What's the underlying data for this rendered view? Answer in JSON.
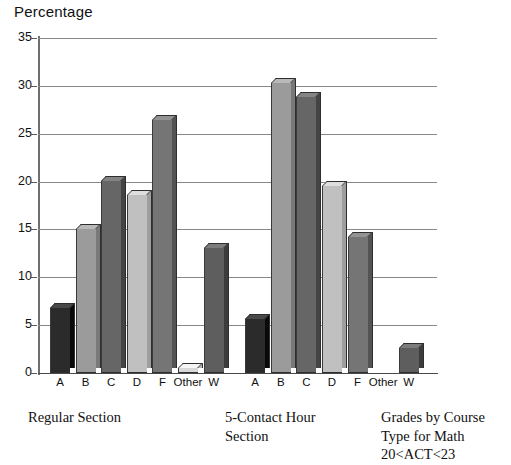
{
  "chart_data": {
    "type": "bar",
    "title": "Percentage",
    "xlabel": "",
    "ylabel": "Percentage",
    "ylim": [
      0,
      35
    ],
    "yticks": [
      0,
      5,
      10,
      15,
      20,
      25,
      30,
      35
    ],
    "grid": true,
    "legend": "none",
    "categories": [
      "A",
      "B",
      "C",
      "D",
      "F",
      "Other",
      "W"
    ],
    "series": [
      {
        "name": "Regular Section",
        "values": [
          6.8,
          15.0,
          20.1,
          18.6,
          26.4,
          0.5,
          13.1
        ]
      },
      {
        "name": "5-Contact Hour Section",
        "values": [
          5.6,
          30.3,
          28.8,
          19.5,
          14.2,
          0.0,
          2.6
        ]
      }
    ],
    "annotations": [
      "Regular Section",
      "5-Contact Hour Section",
      "Grades by Course Type for Math 20<ACT<23"
    ],
    "bar_colors": [
      "#2b2b2b",
      "#9b9b9b",
      "#666666",
      "#c0c0c0",
      "#757575",
      "#d8d8d8",
      "#5e5e5e"
    ]
  },
  "axis": {
    "y_tick_labels": [
      "35",
      "30",
      "25",
      "20",
      "15",
      "10",
      "5",
      "0"
    ],
    "x_tick_labels_group1": [
      "A",
      "B",
      "C",
      "D",
      "F",
      "Other",
      "W"
    ],
    "x_tick_labels_group2": [
      "A",
      "B",
      "C",
      "D",
      "F",
      "Other",
      "W"
    ]
  },
  "captions": {
    "group1": "Regular Section",
    "group2": "5-Contact Hour\nSection",
    "figure": "Grades by Course\nType for Math\n20<ACT<23"
  }
}
